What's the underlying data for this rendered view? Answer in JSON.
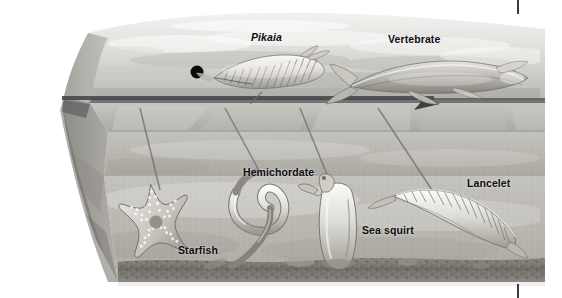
{
  "figure": {
    "name": "chordate-evolution-block-diagram",
    "width": 562,
    "height": 298,
    "background_color": "#ffffff"
  },
  "labels": {
    "pikaia": "Pikaia",
    "vertebrate": "Vertebrate",
    "hemichordate": "Hemichordate",
    "starfish": "Starfish",
    "sea_squirt": "Sea squirt",
    "lancelet": "Lancelet"
  },
  "palette": {
    "label_text": "#0d0d0f",
    "page_rule": "#3a3a3c",
    "water_light": "#e8e8e6",
    "water_mid": "#c9c9c6",
    "water_dark": "#9a9a97",
    "sediment_light": "#cfcdc7",
    "sediment_mid": "#b3b1aa",
    "sediment_dark": "#7f7d77",
    "surface_line": "#4e4e50",
    "marker_dot": "#0a0a0a"
  },
  "markers": {
    "black_dot": {
      "cx": 197,
      "cy": 72,
      "r": 6.5,
      "color": "#0a0a0a"
    },
    "time_arrow": {
      "y": 98,
      "x_start": 62,
      "x_end": 438,
      "arrowhead_size": 13,
      "color": "#4e4e50"
    }
  },
  "page_rules": [
    {
      "name": "page-rule-top",
      "x": 517,
      "y": 0,
      "height": 14
    },
    {
      "name": "page-rule-bottom",
      "x": 517,
      "y": 284,
      "height": 14
    }
  ],
  "organisms": [
    {
      "name": "pikaia",
      "zone": "water",
      "label": "Pikaia"
    },
    {
      "name": "vertebrate",
      "zone": "water",
      "label": "Vertebrate"
    },
    {
      "name": "hemichordate",
      "zone": "sea-floor",
      "label": "Hemichordate"
    },
    {
      "name": "starfish",
      "zone": "sea-floor",
      "label": "Starfish"
    },
    {
      "name": "sea-squirt",
      "zone": "sea-floor",
      "label": "Sea squirt"
    },
    {
      "name": "lancelet",
      "zone": "sea-floor",
      "label": "Lancelet"
    }
  ]
}
